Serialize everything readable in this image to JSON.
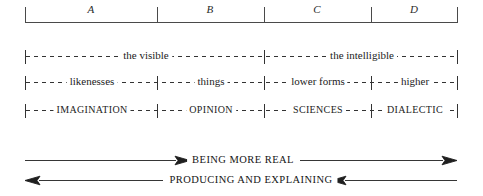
{
  "diagram": {
    "stroke_color": "#3a3a3a",
    "text_color": "#1a1a1a",
    "background_color": "#ffffff",
    "segments": {
      "labels": [
        "A",
        "B",
        "C",
        "D"
      ],
      "boundaries_px": [
        25,
        157,
        264,
        371,
        457
      ],
      "bar_top_px": 22
    },
    "rows": [
      {
        "name": "realms",
        "y_px": 56,
        "style": "roman",
        "cells": [
          {
            "label": "the visible",
            "from_px": 25,
            "to_px": 264
          },
          {
            "label": "the intelligible",
            "from_px": 264,
            "to_px": 457
          }
        ]
      },
      {
        "name": "objects",
        "y_px": 82,
        "style": "roman",
        "cells": [
          {
            "label": "likenesses",
            "from_px": 25,
            "to_px": 157
          },
          {
            "label": "things",
            "from_px": 157,
            "to_px": 264
          },
          {
            "label": "lower forms",
            "from_px": 264,
            "to_px": 371
          },
          {
            "label": "higher",
            "from_px": 371,
            "to_px": 457
          }
        ]
      },
      {
        "name": "states-of-mind",
        "y_px": 110,
        "style": "caps",
        "cells": [
          {
            "label": "IMAGINATION",
            "from_px": 25,
            "to_px": 157
          },
          {
            "label": "OPINION",
            "from_px": 157,
            "to_px": 264
          },
          {
            "label": "SCIENCES",
            "from_px": 264,
            "to_px": 371
          },
          {
            "label": "DIALECTIC",
            "from_px": 371,
            "to_px": 457
          }
        ]
      }
    ],
    "arrows": [
      {
        "name": "being-more-real",
        "caption": "BEING MORE REAL",
        "y_px": 160,
        "direction": "right",
        "from_px": 25,
        "to_px": 457
      },
      {
        "name": "producing-and-explaining",
        "caption": "PRODUCING AND EXPLAINING",
        "y_px": 180,
        "direction": "left",
        "from_px": 25,
        "to_px": 457
      }
    ]
  }
}
